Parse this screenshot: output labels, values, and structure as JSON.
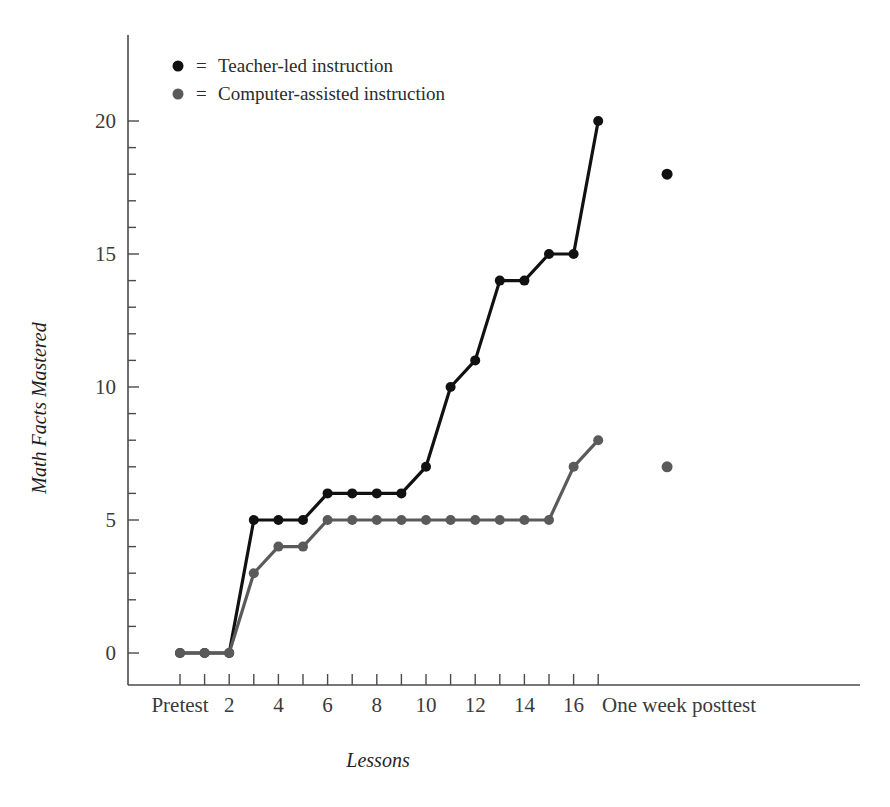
{
  "chart_data": {
    "type": "line",
    "title": "",
    "xlabel": "Lessons",
    "ylabel": "Math Facts Mastered",
    "xlim": [
      0,
      19
    ],
    "ylim": [
      0,
      21
    ],
    "yticks": [
      0,
      5,
      10,
      15,
      20
    ],
    "ytick_labels": [
      "0",
      "5",
      "10",
      "15",
      "20"
    ],
    "y_minor_step": 1,
    "xticks": [
      1,
      2,
      3,
      4,
      5,
      6,
      7,
      8,
      9,
      10,
      11,
      12,
      13,
      14,
      15,
      16,
      17,
      18
    ],
    "xtick_labels": [
      "Pretest",
      "",
      "2",
      "",
      "4",
      "",
      "6",
      "",
      "8",
      "",
      "10",
      "",
      "12",
      "",
      "14",
      "",
      "16",
      ""
    ],
    "posttest_label": "One week posttest",
    "posttest_x": 20.8,
    "grid": false,
    "legend_position": "upper-left-inside",
    "series": [
      {
        "name": "Teacher-led instruction",
        "color": "#111111",
        "marker": "circle",
        "x": [
          1,
          2,
          3,
          4,
          5,
          6,
          7,
          8,
          9,
          10,
          11,
          12,
          13,
          14,
          15,
          16,
          17,
          18
        ],
        "values": [
          0,
          0,
          0,
          5,
          5,
          5,
          6,
          6,
          6,
          6,
          7,
          10,
          11,
          14,
          14,
          15,
          15,
          20
        ],
        "posttest_value": 18
      },
      {
        "name": "Computer-assisted instruction",
        "color": "#5a5a5a",
        "marker": "circle",
        "x": [
          1,
          2,
          3,
          4,
          5,
          6,
          7,
          8,
          9,
          10,
          11,
          12,
          13,
          14,
          15,
          16,
          17,
          18
        ],
        "values": [
          0,
          0,
          0,
          3,
          4,
          4,
          5,
          5,
          5,
          5,
          5,
          5,
          5,
          5,
          5,
          5,
          7,
          8
        ],
        "posttest_value": 7
      }
    ],
    "legend": [
      {
        "label": "Teacher-led instruction",
        "equals": "=",
        "color": "#111111"
      },
      {
        "label": "Computer-assisted instruction",
        "equals": "=",
        "color": "#5a5a5a"
      }
    ]
  }
}
